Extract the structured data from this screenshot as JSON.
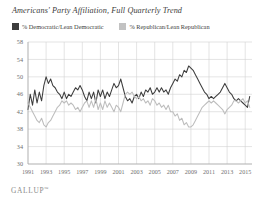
{
  "chart_title": "Americans' Party Affiliation, Full Quarterly Trend",
  "legend": {
    "items": [
      {
        "label": "% Democratic/Lean Democratic",
        "color": "#3d3d3d",
        "key": "democratic"
      },
      {
        "label": "% Republican/Lean Republican",
        "color": "#c2c2c2",
        "key": "republican"
      }
    ]
  },
  "branding": {
    "logo_text": "GALLUP",
    "trademark": "™"
  },
  "chart_data": {
    "type": "line",
    "title": "Americans' Party Affiliation, Full Quarterly Trend",
    "xlabel": "",
    "ylabel": "",
    "ylim": [
      30,
      58
    ],
    "yticks": [
      30,
      34,
      38,
      42,
      46,
      50,
      54,
      58
    ],
    "xlim": [
      1991,
      2015.75
    ],
    "xticks": [
      1991,
      1993,
      1995,
      1997,
      1999,
      2001,
      2003,
      2005,
      2007,
      2009,
      2011,
      2013,
      2015
    ],
    "xtick_labels": [
      "1991",
      "1993",
      "1995",
      "1997",
      "1999",
      "2001",
      "2003",
      "2005",
      "2007",
      "2009",
      "2011",
      "2013",
      "2015"
    ],
    "grid": true,
    "legend_position": "top-left",
    "x": [
      1991.0,
      1991.25,
      1991.5,
      1991.75,
      1992.0,
      1992.25,
      1992.5,
      1992.75,
      1993.0,
      1993.25,
      1993.5,
      1993.75,
      1994.0,
      1994.25,
      1994.5,
      1994.75,
      1995.0,
      1995.25,
      1995.5,
      1995.75,
      1996.0,
      1996.25,
      1996.5,
      1996.75,
      1997.0,
      1997.25,
      1997.5,
      1997.75,
      1998.0,
      1998.25,
      1998.5,
      1998.75,
      1999.0,
      1999.25,
      1999.5,
      1999.75,
      2000.0,
      2000.25,
      2000.5,
      2000.75,
      2001.0,
      2001.25,
      2001.5,
      2001.75,
      2002.0,
      2002.25,
      2002.5,
      2002.75,
      2003.0,
      2003.25,
      2003.5,
      2003.75,
      2004.0,
      2004.25,
      2004.5,
      2004.75,
      2005.0,
      2005.25,
      2005.5,
      2005.75,
      2006.0,
      2006.25,
      2006.5,
      2006.75,
      2007.0,
      2007.25,
      2007.5,
      2007.75,
      2008.0,
      2008.25,
      2008.5,
      2008.75,
      2009.0,
      2009.25,
      2009.5,
      2009.75,
      2010.0,
      2010.25,
      2010.5,
      2010.75,
      2011.0,
      2011.25,
      2011.5,
      2011.75,
      2012.0,
      2012.25,
      2012.5,
      2012.75,
      2013.0,
      2013.25,
      2013.5,
      2013.75,
      2014.0,
      2014.25,
      2014.5,
      2014.75,
      2015.0,
      2015.25,
      2015.5
    ],
    "series": [
      {
        "name": "% Democratic/Lean Democratic",
        "key": "democratic",
        "color": "#3d3d3d",
        "values": [
          42.5,
          46.0,
          43.5,
          47.0,
          44.0,
          46.5,
          44.5,
          48.0,
          50.0,
          48.5,
          49.5,
          48.0,
          47.5,
          46.5,
          46.0,
          45.0,
          46.5,
          45.0,
          46.0,
          45.5,
          46.5,
          47.5,
          47.0,
          48.0,
          47.0,
          45.5,
          44.5,
          46.5,
          45.0,
          46.5,
          44.0,
          47.0,
          45.5,
          47.0,
          45.0,
          46.5,
          45.5,
          47.0,
          48.5,
          47.5,
          48.0,
          49.5,
          47.5,
          45.5,
          44.5,
          45.0,
          44.0,
          45.5,
          46.0,
          45.0,
          46.5,
          45.5,
          47.0,
          46.5,
          47.5,
          46.0,
          46.5,
          47.5,
          46.5,
          47.5,
          46.5,
          47.0,
          46.0,
          47.5,
          48.5,
          49.5,
          49.0,
          50.5,
          50.0,
          51.5,
          51.0,
          52.5,
          52.0,
          51.5,
          50.5,
          49.5,
          48.5,
          47.5,
          46.5,
          46.0,
          45.0,
          45.5,
          45.0,
          45.5,
          46.0,
          46.5,
          47.5,
          48.5,
          47.5,
          46.5,
          46.0,
          45.0,
          44.5,
          45.0,
          44.5,
          44.0,
          43.5,
          43.0,
          45.5
        ]
      },
      {
        "name": "% Republican/Lean Republican",
        "key": "republican",
        "color": "#bdbdbd",
        "values": [
          44.0,
          43.0,
          42.0,
          41.0,
          40.0,
          39.5,
          40.5,
          39.0,
          38.5,
          39.5,
          40.0,
          41.0,
          42.0,
          43.0,
          43.5,
          44.5,
          44.0,
          44.5,
          43.5,
          44.0,
          43.5,
          42.5,
          43.0,
          42.0,
          43.0,
          44.0,
          44.5,
          43.0,
          44.5,
          43.0,
          45.0,
          42.5,
          44.0,
          42.5,
          44.5,
          43.0,
          44.0,
          43.0,
          42.0,
          43.5,
          43.0,
          42.0,
          44.0,
          46.0,
          46.5,
          46.0,
          46.5,
          45.5,
          45.0,
          45.5,
          44.5,
          45.0,
          44.0,
          44.5,
          43.5,
          45.0,
          44.5,
          43.5,
          44.0,
          43.0,
          43.5,
          42.5,
          43.5,
          42.0,
          42.0,
          41.0,
          41.5,
          40.0,
          40.5,
          39.0,
          39.5,
          38.5,
          38.5,
          39.0,
          40.0,
          41.0,
          42.0,
          43.0,
          43.5,
          44.0,
          44.5,
          44.0,
          44.5,
          44.0,
          43.5,
          43.0,
          42.5,
          41.5,
          42.5,
          43.0,
          43.5,
          44.5,
          44.5,
          44.0,
          44.5,
          45.0,
          44.0,
          44.5,
          43.0
        ]
      }
    ]
  }
}
